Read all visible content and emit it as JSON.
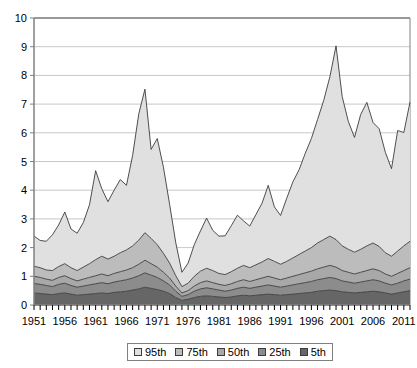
{
  "chart_data": {
    "type": "area",
    "stacked": true,
    "title": "",
    "xlabel": "",
    "ylabel": "",
    "ylim": [
      0,
      10
    ],
    "xlim": [
      1951,
      2012
    ],
    "ytick_step": 1,
    "yticks": [
      "0",
      "1",
      "2",
      "3",
      "4",
      "5",
      "6",
      "7",
      "8",
      "9",
      "10"
    ],
    "xticks": [
      "1951",
      "1956",
      "1961",
      "1966",
      "1971",
      "1976",
      "1981",
      "1986",
      "1991",
      "1996",
      "2001",
      "2006",
      "2011"
    ],
    "xtick_step": 5,
    "minor_xticks": true,
    "grid": "horizontal",
    "legend_position": "bottom",
    "x": [
      1951,
      1952,
      1953,
      1954,
      1955,
      1956,
      1957,
      1958,
      1959,
      1960,
      1961,
      1962,
      1963,
      1964,
      1965,
      1966,
      1967,
      1968,
      1969,
      1970,
      1971,
      1972,
      1973,
      1974,
      1975,
      1976,
      1977,
      1978,
      1979,
      1980,
      1981,
      1982,
      1983,
      1984,
      1985,
      1986,
      1987,
      1988,
      1989,
      1990,
      1991,
      1992,
      1993,
      1994,
      1995,
      1996,
      1997,
      1998,
      1999,
      2000,
      2001,
      2002,
      2003,
      2004,
      2005,
      2006,
      2007,
      2008,
      2009,
      2010,
      2011,
      2012
    ],
    "series": [
      {
        "name": "5th",
        "color": "#666666",
        "values": [
          0.42,
          0.4,
          0.38,
          0.36,
          0.4,
          0.42,
          0.38,
          0.34,
          0.36,
          0.38,
          0.4,
          0.42,
          0.4,
          0.44,
          0.46,
          0.48,
          0.52,
          0.56,
          0.62,
          0.58,
          0.54,
          0.48,
          0.4,
          0.26,
          0.16,
          0.2,
          0.26,
          0.3,
          0.32,
          0.3,
          0.28,
          0.26,
          0.28,
          0.32,
          0.34,
          0.32,
          0.34,
          0.36,
          0.38,
          0.36,
          0.34,
          0.36,
          0.38,
          0.4,
          0.42,
          0.44,
          0.48,
          0.5,
          0.52,
          0.5,
          0.46,
          0.44,
          0.42,
          0.44,
          0.46,
          0.48,
          0.46,
          0.42,
          0.38,
          0.42,
          0.46,
          0.5
        ]
      },
      {
        "name": "25th",
        "color": "#8c8c8c",
        "values": [
          0.33,
          0.32,
          0.3,
          0.28,
          0.32,
          0.34,
          0.3,
          0.28,
          0.3,
          0.32,
          0.34,
          0.36,
          0.34,
          0.36,
          0.38,
          0.4,
          0.42,
          0.46,
          0.5,
          0.46,
          0.42,
          0.36,
          0.3,
          0.22,
          0.14,
          0.16,
          0.22,
          0.26,
          0.28,
          0.26,
          0.24,
          0.22,
          0.24,
          0.26,
          0.28,
          0.26,
          0.28,
          0.3,
          0.32,
          0.3,
          0.28,
          0.3,
          0.32,
          0.34,
          0.36,
          0.38,
          0.4,
          0.42,
          0.44,
          0.42,
          0.38,
          0.36,
          0.34,
          0.36,
          0.38,
          0.4,
          0.38,
          0.34,
          0.32,
          0.34,
          0.38,
          0.4
        ]
      },
      {
        "name": "50th",
        "color": "#a8a8a8",
        "values": [
          0.25,
          0.24,
          0.22,
          0.22,
          0.24,
          0.26,
          0.24,
          0.22,
          0.24,
          0.26,
          0.28,
          0.3,
          0.28,
          0.3,
          0.32,
          0.34,
          0.36,
          0.4,
          0.44,
          0.4,
          0.36,
          0.3,
          0.24,
          0.18,
          0.12,
          0.14,
          0.18,
          0.22,
          0.24,
          0.22,
          0.2,
          0.2,
          0.22,
          0.24,
          0.26,
          0.24,
          0.26,
          0.28,
          0.3,
          0.28,
          0.26,
          0.28,
          0.3,
          0.32,
          0.34,
          0.36,
          0.38,
          0.4,
          0.42,
          0.4,
          0.36,
          0.34,
          0.32,
          0.34,
          0.36,
          0.38,
          0.36,
          0.32,
          0.3,
          0.34,
          0.36,
          0.4
        ]
      },
      {
        "name": "75th",
        "color": "#bcbcbc",
        "values": [
          0.35,
          0.34,
          0.32,
          0.34,
          0.38,
          0.42,
          0.38,
          0.36,
          0.42,
          0.48,
          0.56,
          0.62,
          0.58,
          0.6,
          0.66,
          0.7,
          0.76,
          0.84,
          0.96,
          0.88,
          0.78,
          0.66,
          0.52,
          0.36,
          0.22,
          0.26,
          0.34,
          0.4,
          0.44,
          0.42,
          0.38,
          0.38,
          0.42,
          0.46,
          0.5,
          0.48,
          0.52,
          0.56,
          0.62,
          0.58,
          0.54,
          0.58,
          0.64,
          0.7,
          0.76,
          0.82,
          0.9,
          0.96,
          1.02,
          0.96,
          0.86,
          0.8,
          0.76,
          0.8,
          0.86,
          0.9,
          0.84,
          0.74,
          0.7,
          0.78,
          0.86,
          0.92
        ]
      },
      {
        "name": "95th",
        "color": "#e0e0e0",
        "values": [
          1.05,
          0.95,
          1.0,
          1.25,
          1.45,
          1.8,
          1.35,
          1.3,
          1.55,
          2.05,
          3.1,
          2.35,
          2.0,
          2.3,
          2.55,
          2.25,
          3.15,
          4.4,
          5.0,
          3.1,
          3.7,
          3.0,
          2.05,
          1.15,
          0.5,
          0.7,
          1.1,
          1.4,
          1.75,
          1.4,
          1.3,
          1.35,
          1.6,
          1.85,
          1.55,
          1.45,
          1.75,
          2.05,
          2.55,
          1.9,
          1.7,
          2.2,
          2.65,
          2.95,
          3.4,
          3.8,
          4.3,
          4.85,
          5.55,
          6.75,
          5.2,
          4.45,
          4.0,
          4.7,
          5.0,
          4.2,
          4.1,
          3.5,
          3.05,
          4.2,
          3.95,
          4.85
        ]
      }
    ]
  },
  "legend": {
    "items": [
      {
        "label": "95th",
        "color": "#e0e0e0"
      },
      {
        "label": "75th",
        "color": "#bcbcbc"
      },
      {
        "label": "50th",
        "color": "#a8a8a8"
      },
      {
        "label": "25th",
        "color": "#8c8c8c"
      },
      {
        "label": "5th",
        "color": "#666666"
      }
    ]
  },
  "style": {
    "axis_color": "#808080",
    "grid_color": "#c8c8c8",
    "line_color": "#3c3c3c",
    "text_color": "#000000"
  }
}
